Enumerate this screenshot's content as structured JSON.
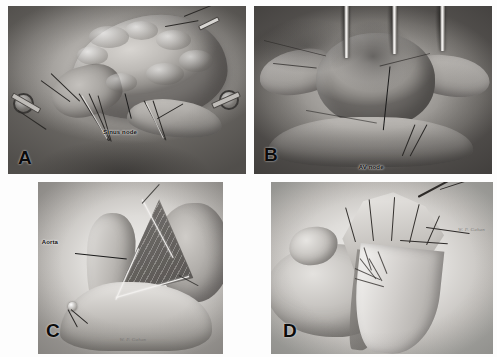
{
  "figure": {
    "kind": "surgical-illustration-plate",
    "panel_count": 4,
    "palette": {
      "background": "#ffffff",
      "ink": "#101010",
      "panel_mid_gray": "#a9a6a2",
      "panel_dark_gray": "#5e5b58",
      "panel_light_gray": "#e8e6e3"
    }
  },
  "panels": [
    {
      "letter": "A",
      "name": "panel-a",
      "subject": "right atrium with sinus node region exposed, encircled caval vessel loops and traction sutures",
      "annotations": [
        {
          "label": "Sinus node",
          "has_leader_line": true
        }
      ],
      "signature": ""
    },
    {
      "letter": "B",
      "name": "panel-b",
      "subject": "opened atrium with retractor blades, atrioventricular node region identified",
      "annotations": [
        {
          "label": "AV node",
          "has_leader_line": true
        }
      ],
      "signature": ""
    },
    {
      "letter": "C",
      "name": "panel-c",
      "subject": "aortotomy with triangular opened window exposing aortic root",
      "annotations": [
        {
          "label": "Aorta",
          "has_leader_line": true
        }
      ],
      "signature": "W. P. Gahan"
    },
    {
      "letter": "D",
      "name": "panel-d",
      "subject": "coronary graft anastomosis with conduit sweeping over the ventricle",
      "annotations": [],
      "signature": "W. P. Gahan"
    }
  ]
}
